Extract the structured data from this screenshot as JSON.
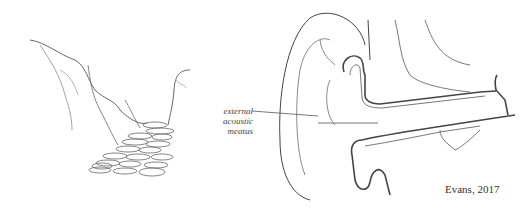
{
  "figure": {
    "left_panel": {
      "subject": "rocky canyon path"
    },
    "right_panel": {
      "subject": "ear cross-section"
    },
    "labels": {
      "meatus_line1": "external acoustic",
      "meatus_line2": "meatus"
    },
    "credit": "Evans, 2017"
  }
}
